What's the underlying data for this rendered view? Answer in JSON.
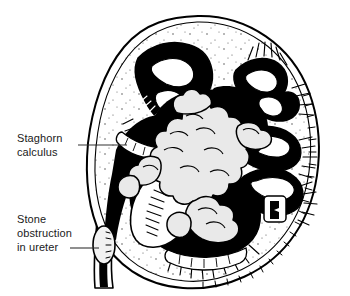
{
  "figure": {
    "style": "black-and-white line drawing",
    "background_color": "#ffffff",
    "ink_color": "#000000",
    "calculus_fill": "#e8e8e8"
  },
  "annotations": [
    {
      "name": "staghorn-calculus",
      "lines": [
        "Staghorn",
        "calculus"
      ],
      "text_x": 17,
      "text_y": 131,
      "leader": {
        "x1": 78,
        "y1": 145,
        "x2": 127,
        "y2": 145
      }
    },
    {
      "name": "stone-obstruction",
      "lines": [
        "Stone",
        "obstruction",
        "in ureter"
      ],
      "text_x": 17,
      "text_y": 212,
      "leader": {
        "x1": 70,
        "y1": 248,
        "x2": 99,
        "y2": 248
      }
    }
  ],
  "structures": [
    {
      "name": "renal-capsule",
      "label": "Renal capsule (outer kidney outline)"
    },
    {
      "name": "renal-cortex",
      "label": "Renal cortex"
    },
    {
      "name": "renal-medulla",
      "label": "Renal medulla with radiating striations"
    },
    {
      "name": "upper-pole-calyx",
      "label": "Dilated upper pole calyx"
    },
    {
      "name": "middle-calyces",
      "label": "Dilated middle calyces"
    },
    {
      "name": "lower-pole-calyx",
      "label": "Dilated lower pole calyx"
    },
    {
      "name": "renal-pelvis",
      "label": "Renal pelvis"
    },
    {
      "name": "staghorn-calculus",
      "label": "Branching staghorn calculus filling pelvicalyceal system"
    },
    {
      "name": "ureter",
      "label": "Dilated proximal ureter"
    },
    {
      "name": "ureteric-stone",
      "label": "Impacted stone obstructing ureter"
    },
    {
      "name": "renal-hilum",
      "label": "Renal hilum"
    }
  ]
}
